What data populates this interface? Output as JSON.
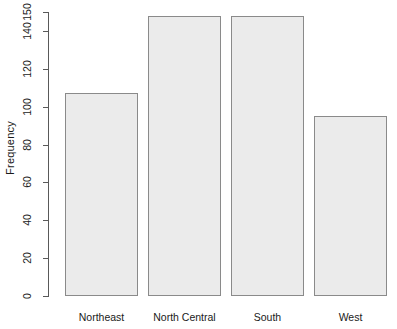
{
  "chart_data": {
    "type": "bar",
    "title": "",
    "subtitle": "",
    "xlabel": "",
    "ylabel": "Frequency",
    "categories": [
      "Northeast",
      "North Central",
      "South",
      "West"
    ],
    "values": [
      107,
      148,
      148,
      95
    ],
    "ylim": [
      0,
      150
    ],
    "ytick_labels": [
      "0",
      "20",
      "40",
      "60",
      "80",
      "100",
      "120",
      "140",
      "150"
    ],
    "ytick_values": [
      0,
      20,
      40,
      60,
      80,
      100,
      120,
      140,
      150
    ],
    "grid": false,
    "legend": null,
    "bar_fill_color": "#ebebeb",
    "bar_border_color": "#8a8a8a",
    "axis_color": "#595959",
    "background_color": "#ffffff"
  }
}
